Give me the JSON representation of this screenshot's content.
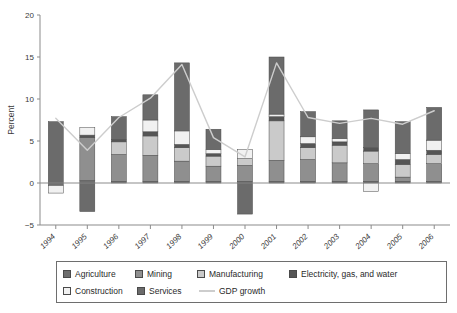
{
  "chart_data": {
    "type": "bar",
    "subtype": "stacked-bar-with-line",
    "title": "",
    "xlabel": "",
    "ylabel": "Percent",
    "ylim": [
      -5,
      20
    ],
    "yticks": [
      -5,
      0,
      5,
      10,
      15,
      20
    ],
    "ytick_labels": [
      "−5",
      "0",
      "5",
      "10",
      "15",
      "20"
    ],
    "grid": false,
    "legend_position": "bottom",
    "categories": [
      "1994",
      "1995",
      "1996",
      "1997",
      "1998",
      "1999",
      "2000",
      "2001",
      "2002",
      "2003",
      "2004",
      "2005",
      "2006"
    ],
    "series": [
      {
        "name": "Agriculture",
        "color": "#6e6e6e",
        "values": [
          -0.3,
          0.3,
          0.2,
          0.2,
          0.2,
          0.2,
          0.2,
          0.2,
          0.2,
          0.2,
          0.2,
          0.2,
          0.2
        ]
      },
      {
        "name": "Mining",
        "color": "#8f8f8f",
        "values": [
          0.0,
          5.1,
          3.2,
          3.1,
          2.4,
          1.8,
          1.9,
          2.5,
          2.6,
          2.2,
          2.1,
          0.5,
          2.1
        ]
      },
      {
        "name": "Manufacturing",
        "color": "#cacaca",
        "values": [
          0.0,
          0.0,
          1.5,
          2.3,
          1.6,
          1.2,
          0.8,
          4.7,
          1.4,
          2.1,
          1.5,
          1.5,
          1.1
        ]
      },
      {
        "name": "Electricity, gas, and water",
        "color": "#555555",
        "values": [
          0.0,
          0.3,
          0.3,
          0.5,
          0.4,
          0.3,
          0.0,
          0.5,
          0.5,
          0.4,
          0.4,
          0.6,
          0.5
        ]
      },
      {
        "name": "Construction",
        "color": "#f1f1f1",
        "values": [
          2.2,
          0.9,
          0.0,
          1.4,
          1.6,
          0.5,
          1.1,
          0.3,
          0.8,
          0.4,
          -1.0,
          0.7,
          1.2
        ]
      },
      {
        "name": "Services",
        "color": "#6b6b6b",
        "values": [
          7.3,
          0.6,
          2.7,
          3.0,
          8.1,
          2.4,
          2.0,
          6.8,
          3.0,
          2.1,
          4.5,
          3.8,
          3.9
        ]
      }
    ],
    "negative_segments": [
      {
        "category": "1994",
        "series": "Agriculture",
        "value": -0.3,
        "note": "bar dips below zero"
      },
      {
        "category": "1994",
        "series": "Construction",
        "value": -0.9
      },
      {
        "category": "1995",
        "series": "Services",
        "value": -3.4
      },
      {
        "category": "2000",
        "series": "Services",
        "value": -3.7
      },
      {
        "category": "2004",
        "series": "Construction",
        "value": -1.0
      }
    ],
    "line_series": {
      "name": "GDP growth",
      "color": "#cdcdcd",
      "values": [
        7.7,
        3.9,
        7.8,
        10.1,
        14.1,
        5.4,
        3.1,
        14.3,
        7.8,
        7.1,
        7.7,
        7.0,
        8.6
      ]
    },
    "bar_totals_positive": [
      9.5,
      7.2,
      7.9,
      10.5,
      14.3,
      6.4,
      5.9,
      14.6,
      8.3,
      7.2,
      8.8,
      7.1,
      8.9
    ],
    "bar_totals_negative": [
      -1.2,
      -3.4,
      0,
      0,
      0,
      0,
      -3.7,
      0,
      0,
      -0.3,
      -1.1,
      0,
      0
    ]
  },
  "legend": {
    "rows": [
      [
        {
          "label": "Agriculture",
          "kind": "swatch",
          "color": "#6e6e6e"
        },
        {
          "label": "Mining",
          "kind": "swatch",
          "color": "#8f8f8f"
        },
        {
          "label": "Manufacturing",
          "kind": "swatch",
          "color": "#cacaca"
        },
        {
          "label": "Electricity, gas, and water",
          "kind": "swatch",
          "color": "#555555"
        }
      ],
      [
        {
          "label": "Construction",
          "kind": "swatch",
          "color": "#f1f1f1"
        },
        {
          "label": "Services",
          "kind": "swatch",
          "color": "#6b6b6b"
        },
        {
          "label": "GDP growth",
          "kind": "line",
          "color": "#cdcdcd"
        }
      ]
    ]
  }
}
